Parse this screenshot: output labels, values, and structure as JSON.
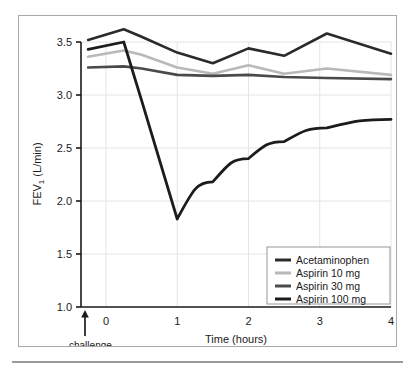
{
  "figure": {
    "frame_border_color": "#a8a8a8",
    "background": "#ffffff",
    "rule_color": "#9a9a9a"
  },
  "chart_data": {
    "type": "line",
    "title": "",
    "subtitle": "",
    "xlabel": "Time (hours)",
    "ylabel": "FEV₁ (L/min)",
    "ylabel_main": "FEV",
    "ylabel_sub": "1",
    "ylabel_tail": " (L/min)",
    "xlim": [
      -0.35,
      4.0
    ],
    "ylim": [
      1.0,
      3.5
    ],
    "grid": true,
    "grid_color": "#e4e4e4",
    "legend_position": "lower right",
    "xticks": [
      0,
      1,
      2,
      3,
      4
    ],
    "xticklabels": [
      "0",
      "1",
      "2",
      "3",
      "4"
    ],
    "yticks": [
      1.0,
      1.5,
      2.0,
      2.5,
      3.0,
      3.5
    ],
    "yticklabels": [
      "1.0",
      "1.5",
      "2.0",
      "2.5",
      "3.0",
      "3.5"
    ],
    "annotations": [
      {
        "text": "challenge",
        "x": -0.28,
        "y": 1.0,
        "marker": "up-arrow"
      }
    ],
    "x": [
      -0.25,
      0.25,
      0.5,
      1.0,
      1.5,
      2.0,
      2.5,
      3.1,
      4.0
    ],
    "series": [
      {
        "name": "Acetaminophen",
        "color": "#2b2b2b",
        "width": 2.6,
        "values": [
          3.52,
          3.62,
          3.55,
          3.4,
          3.3,
          3.44,
          3.37,
          3.58,
          3.39
        ]
      },
      {
        "name": "Aspirin 10 mg",
        "color": "#b9b9b9",
        "width": 2.6,
        "values": [
          3.36,
          3.42,
          3.38,
          3.26,
          3.2,
          3.28,
          3.2,
          3.25,
          3.19
        ]
      },
      {
        "name": "Aspirin 30 mg",
        "color": "#4a4a4a",
        "width": 2.6,
        "values": [
          3.26,
          3.27,
          3.25,
          3.19,
          3.18,
          3.19,
          3.17,
          3.16,
          3.15
        ]
      },
      {
        "name": "Aspirin 100 mg",
        "color": "#1c1c1c",
        "width": 2.8,
        "values": [
          3.43,
          3.5,
          2.95,
          1.83,
          2.18,
          2.4,
          2.56,
          2.69,
          2.77
        ]
      }
    ],
    "legend_entries": [
      {
        "label": "Acetaminophen",
        "color": "#2b2b2b"
      },
      {
        "label": "Aspirin 10 mg",
        "color": "#b9b9b9"
      },
      {
        "label": "Aspirin 30 mg",
        "color": "#4a4a4a"
      },
      {
        "label": "Aspirin 100 mg",
        "color": "#1c1c1c"
      }
    ]
  }
}
